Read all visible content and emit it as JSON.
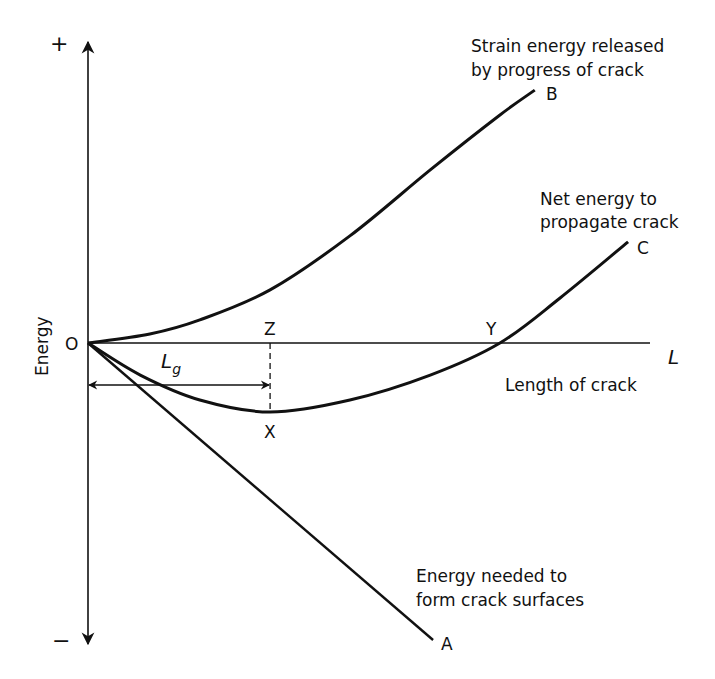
{
  "chart_data": {
    "type": "line",
    "title": "",
    "xlabel": "Length of crack",
    "x_axis_symbol": "L",
    "ylabel": "Energy",
    "y_positive_label": "+",
    "y_negative_label": "−",
    "origin_label": "O",
    "grid": false,
    "x_range": [
      0,
      10
    ],
    "y_range": [
      -10,
      10
    ],
    "series": [
      {
        "id": "B",
        "name": "Strain energy released by progress of crack",
        "label_lines": [
          "Strain energy released",
          "by progress of crack"
        ],
        "end_letter": "B",
        "points": [
          [
            0,
            0
          ],
          [
            1.1,
            0.3
          ],
          [
            1.99,
            0.77
          ],
          [
            3.24,
            1.77
          ],
          [
            4.66,
            3.57
          ],
          [
            6.09,
            5.77
          ],
          [
            7.33,
            7.6
          ],
          [
            7.95,
            8.43
          ]
        ]
      },
      {
        "id": "C",
        "name": "Net energy to propagate crack",
        "label_lines": [
          "Net energy to",
          "propagate crack"
        ],
        "end_letter": "C",
        "points": [
          [
            0,
            0
          ],
          [
            0.93,
            -1.07
          ],
          [
            1.99,
            -1.9
          ],
          [
            3.24,
            -2.3
          ],
          [
            4.66,
            -1.9
          ],
          [
            6.09,
            -1.07
          ],
          [
            7.33,
            0
          ],
          [
            8.4,
            1.5
          ],
          [
            9.61,
            3.37
          ]
        ]
      },
      {
        "id": "A",
        "name": "Energy needed to form crack surfaces",
        "label_lines": [
          "Energy needed to",
          "form crack surfaces"
        ],
        "end_letter": "A",
        "points": [
          [
            0,
            0
          ],
          [
            6.14,
            -9.9
          ]
        ]
      }
    ],
    "annotations": {
      "Z": {
        "label": "Z",
        "x": 3.24,
        "y": 0
      },
      "X": {
        "label": "X",
        "x": 3.24,
        "y": -2.3
      },
      "Y": {
        "label": "Y",
        "x": 7.33,
        "y": 0
      },
      "Lg": {
        "label": "L",
        "subscript": "g",
        "from_x": 0,
        "to_x": 3.24,
        "y": -1.4
      }
    }
  }
}
